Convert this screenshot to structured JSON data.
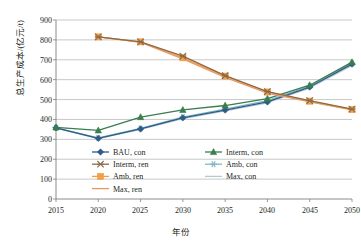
{
  "chart_data": {
    "type": "line",
    "title": "",
    "xlabel": "年份",
    "ylabel": "总生产成本/(亿元/t)",
    "x": [
      2015,
      2020,
      2025,
      2030,
      2035,
      2040,
      2045,
      2050
    ],
    "xticks": [
      "2015",
      "2020",
      "2025",
      "2030",
      "2035",
      "2040",
      "2045",
      "2050"
    ],
    "yticks": [
      "0",
      "100",
      "200",
      "300",
      "400",
      "500",
      "600",
      "700",
      "800",
      "900"
    ],
    "ylim": [
      0,
      900
    ],
    "xlim": [
      2015,
      2050
    ],
    "grid": "horizontal",
    "legend_position": "inside-bottom-left",
    "series": [
      {
        "name": "BAU, con",
        "color": "#2e5c8a",
        "marker": "diamond",
        "x": [
          2015,
          2020,
          2025,
          2030,
          2035,
          2040,
          2045,
          2050
        ],
        "values": [
          358,
          305,
          352,
          408,
          447,
          488,
          563,
          678
        ]
      },
      {
        "name": "Interm, con",
        "color": "#3a7d4e",
        "marker": "triangle",
        "x": [
          2015,
          2020,
          2025,
          2030,
          2035,
          2040,
          2045,
          2050
        ],
        "values": [
          360,
          345,
          412,
          448,
          470,
          505,
          572,
          688
        ]
      },
      {
        "name": "Amb, con",
        "color": "#7bb7c4",
        "marker": "asterisk",
        "x": [
          2015,
          2020,
          2025,
          2030,
          2035,
          2040,
          2045,
          2050
        ],
        "values": [
          358,
          307,
          355,
          412,
          452,
          495,
          568,
          683
        ]
      },
      {
        "name": "Max, con",
        "color": "#b9c7cf",
        "marker": "line",
        "x": [
          2015,
          2020,
          2025,
          2030,
          2035,
          2040,
          2045,
          2050
        ],
        "values": [
          356,
          303,
          350,
          404,
          443,
          484,
          558,
          672
        ]
      },
      {
        "name": "Interm, ren",
        "color": "#8a6a4a",
        "marker": "cross",
        "x": [
          2020,
          2025,
          2030,
          2035,
          2040,
          2045,
          2050
        ],
        "values": [
          815,
          790,
          718,
          620,
          540,
          495,
          452
        ]
      },
      {
        "name": "Amb, ren",
        "color": "#f0a04b",
        "marker": "square",
        "x": [
          2020,
          2025,
          2030,
          2035,
          2040,
          2045,
          2050
        ],
        "values": [
          815,
          790,
          710,
          618,
          538,
          492,
          450
        ]
      },
      {
        "name": "Max, ren",
        "color": "#e8956a",
        "marker": "line",
        "x": [
          2020,
          2025,
          2030,
          2035,
          2040,
          2045,
          2050
        ],
        "values": [
          815,
          788,
          705,
          612,
          532,
          488,
          448
        ]
      }
    ],
    "legend_left_column": [
      "BAU, con",
      "Interm, ren",
      "Amb, ren",
      "Max, ren"
    ],
    "legend_right_column": [
      "Interm, con",
      "Amb, con",
      "Max, con"
    ]
  }
}
